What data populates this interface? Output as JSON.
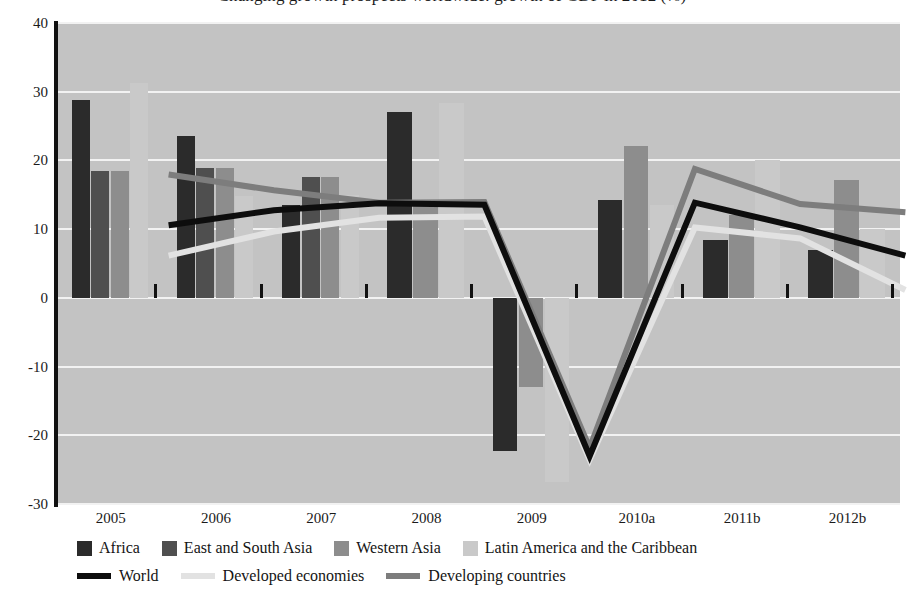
{
  "chart_data": {
    "type": "bar",
    "title": "Changing growth prospects worldwide: growth of GDP in 2012 (%)",
    "xlabel": "",
    "ylabel": "",
    "categories": [
      "2005",
      "2006",
      "2007",
      "2008",
      "2009",
      "2010a",
      "2011b",
      "2012b"
    ],
    "ylim": [
      -30,
      40
    ],
    "ytick_values": [
      40,
      30,
      20,
      10,
      0,
      -10,
      -20,
      -30
    ],
    "ytick_labels": [
      "40",
      "30",
      "20",
      "10",
      "0",
      "-10",
      "-20",
      "-30"
    ],
    "ystep": 10,
    "grid": true,
    "legend_position": "bottom",
    "plot_background": "#c3c3c3",
    "gridline_color": "#f2f2f2",
    "bar_series": [
      {
        "name": "Africa",
        "color": "#2b2b2b",
        "values": [
          28.8,
          23.6,
          13.5,
          27.0,
          -22.3,
          14.2,
          8.4,
          7.0
        ]
      },
      {
        "name": "East and South Asia",
        "color": "#4f4f4f",
        "values": [
          18.5,
          18.9,
          17.6,
          null,
          null,
          null,
          null,
          null
        ]
      },
      {
        "name": "Western Asia",
        "color": "#8d8d8d",
        "values": [
          18.5,
          18.9,
          17.6,
          14.0,
          -13.0,
          22.1,
          12.0,
          17.2
        ]
      },
      {
        "name": "Latin America and the Caribbean",
        "color": "#c9c9c9",
        "values": [
          31.2,
          14.8,
          15.0,
          28.4,
          -26.8,
          13.5,
          20.1,
          10.0
        ]
      }
    ],
    "line_series": [
      {
        "name": "World",
        "color": "#0d0d0d",
        "width": 6,
        "values": [
          13.9,
          16.1,
          17.1,
          16.9,
          -19.7,
          17.2,
          13.6,
          9.5
        ]
      },
      {
        "name": "Developed economies",
        "color": "#e2e2e2",
        "width": 6,
        "values": [
          9.5,
          13.0,
          15.0,
          15.2,
          -20.2,
          13.6,
          12.0,
          4.5
        ]
      },
      {
        "name": "Developing countries",
        "color": "#7d7d7d",
        "width": 6,
        "values": [
          21.3,
          19.0,
          17.2,
          17.3,
          -18.5,
          22.1,
          17.0,
          15.8
        ]
      }
    ]
  },
  "axis": {
    "y_axis_color": "#111111",
    "x_tick_color": "#111111"
  },
  "legend": {
    "bar_items": [
      {
        "label": "Africa",
        "color": "#2b2b2b"
      },
      {
        "label": "East and South Asia",
        "color": "#4f4f4f"
      },
      {
        "label": "Western Asia",
        "color": "#8d8d8d"
      },
      {
        "label": "Latin America and the Caribbean",
        "color": "#c9c9c9"
      }
    ],
    "line_items": [
      {
        "label": "World",
        "color": "#0d0d0d"
      },
      {
        "label": "Developed economies",
        "color": "#e2e2e2"
      },
      {
        "label": "Developing countries",
        "color": "#7d7d7d"
      }
    ]
  }
}
